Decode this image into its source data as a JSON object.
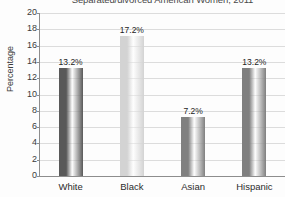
{
  "chart_data": {
    "type": "bar",
    "title": "Separated/divorced American Women, 2011",
    "xlabel": "",
    "ylabel": "Percentage",
    "categories": [
      "White",
      "Black",
      "Asian",
      "Hispanic"
    ],
    "values": [
      13.2,
      17.2,
      7.2,
      13.2
    ],
    "data_labels": [
      "13.2%",
      "17.2%",
      "7.2%",
      "13.2%"
    ],
    "bar_colors": [
      "#595959",
      "#d3d3d3",
      "#808080",
      "#7f7f7f"
    ],
    "ylim": [
      0,
      20
    ],
    "yticks": [
      0,
      2,
      4,
      6,
      8,
      10,
      12,
      14,
      16,
      18,
      20
    ],
    "ytick_labels": [
      "0",
      "2",
      "4",
      "6",
      "8",
      "10",
      "12",
      "14",
      "16",
      "18",
      "20"
    ],
    "grid": true,
    "grid_axis": "y",
    "grid_color": "#dcdcdc",
    "legend": false,
    "legend_position": "none",
    "background_color": "#fdfdfd",
    "axis_color": "#8d8d8d",
    "title_clipped": true
  }
}
